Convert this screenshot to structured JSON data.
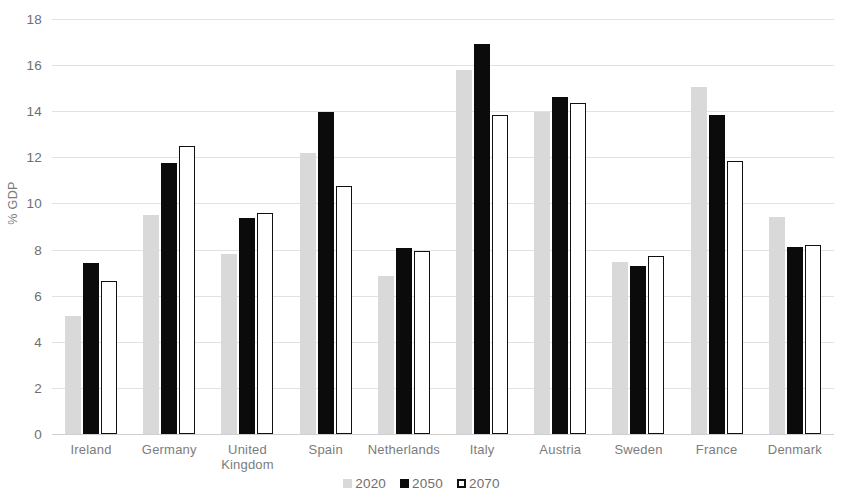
{
  "chart_data": {
    "type": "bar",
    "title": "",
    "xlabel": "",
    "ylabel": "% GDP",
    "ylim": [
      0,
      18
    ],
    "yticks": [
      0,
      2,
      4,
      6,
      8,
      10,
      12,
      14,
      16,
      18
    ],
    "grid": true,
    "legend_position": "bottom",
    "categories": [
      "Ireland",
      "Germany",
      "United Kingdom",
      "Spain",
      "Netherlands",
      "Italy",
      "Austria",
      "Sweden",
      "France",
      "Denmark"
    ],
    "series": [
      {
        "name": "2020",
        "color": "#d9d9d9",
        "values": [
          5.1,
          9.5,
          7.8,
          12.2,
          6.85,
          15.8,
          13.95,
          7.45,
          15.05,
          9.4
        ]
      },
      {
        "name": "2050",
        "color": "#0b0b0b",
        "values": [
          7.4,
          11.75,
          9.35,
          13.95,
          8.05,
          16.9,
          14.6,
          7.3,
          13.85,
          8.1
        ]
      },
      {
        "name": "2070",
        "color": "#ffffff",
        "values": [
          6.65,
          12.5,
          9.6,
          10.75,
          7.95,
          13.85,
          14.35,
          7.7,
          11.85,
          8.2
        ]
      }
    ]
  },
  "axis": {
    "y_title": "% GDP"
  },
  "legend": {
    "items": [
      {
        "label": "2020",
        "swatch": "filled-light-grey-square"
      },
      {
        "label": "2050",
        "swatch": "filled-black-square"
      },
      {
        "label": "2070",
        "swatch": "outlined-white-square"
      }
    ]
  }
}
